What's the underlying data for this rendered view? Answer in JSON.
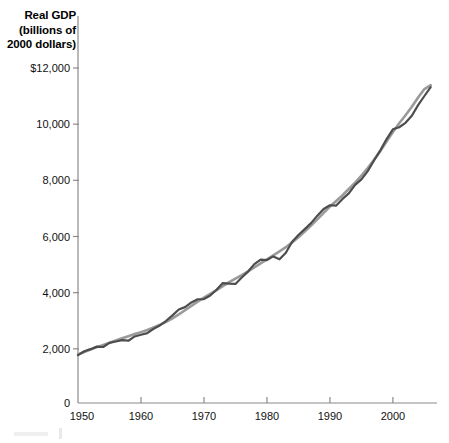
{
  "chart_data": {
    "type": "line",
    "title": "Real GDP (billions of 2000 dollars)",
    "title_line1": "Real GDP",
    "title_line2": "(billions of",
    "title_line3": "2000 dollars)",
    "xlabel": "",
    "ylabel": "Real GDP (billions of 2000 dollars)",
    "xlim": [
      1950,
      2007
    ],
    "ylim": [
      0,
      12000
    ],
    "grid": false,
    "legend_position": "none",
    "y_ticks": [
      2000,
      4000,
      6000,
      8000,
      10000,
      12000
    ],
    "y_tick_labels": [
      "2,000",
      "4,000",
      "6,000",
      "8,000",
      "10,000",
      "$12,000"
    ],
    "origin_label": "0",
    "x_ticks": [
      1950,
      1960,
      1970,
      1980,
      1990,
      2000
    ],
    "x_tick_labels": [
      "1950",
      "1960",
      "1970",
      "1980",
      "1990",
      "2000"
    ],
    "colors": {
      "actual_line": "#4d4d4d",
      "potential_line": "#9a9a9a",
      "axis": "#8a8a8a",
      "text": "#111111"
    },
    "x": [
      1950,
      1951,
      1952,
      1953,
      1954,
      1955,
      1956,
      1957,
      1958,
      1959,
      1960,
      1961,
      1962,
      1963,
      1964,
      1965,
      1966,
      1967,
      1968,
      1969,
      1970,
      1971,
      1972,
      1973,
      1974,
      1975,
      1976,
      1977,
      1978,
      1979,
      1980,
      1981,
      1982,
      1983,
      1984,
      1985,
      1986,
      1987,
      1988,
      1989,
      1990,
      1991,
      1992,
      1993,
      1994,
      1995,
      1996,
      1997,
      1998,
      1999,
      2000,
      2001,
      2002,
      2003,
      2004,
      2005,
      2006
    ],
    "series": [
      {
        "name": "Real GDP",
        "style": "solid-dark",
        "values": [
          1777,
          1915,
          1988,
          2079,
          2065,
          2213,
          2261,
          2309,
          2289,
          2441,
          2502,
          2560,
          2715,
          2834,
          2999,
          3192,
          3399,
          3485,
          3653,
          3765,
          3772,
          3899,
          4105,
          4342,
          4320,
          4311,
          4541,
          4751,
          5015,
          5173,
          5162,
          5292,
          5189,
          5424,
          5814,
          6054,
          6264,
          6475,
          6743,
          6981,
          7113,
          7101,
          7337,
          7533,
          7836,
          8032,
          8329,
          8704,
          9067,
          9470,
          9817,
          9891,
          10049,
          10301,
          10676,
          11003,
          11319
        ],
        "color": "#4d4d4d"
      },
      {
        "name": "Potential GDP",
        "style": "solid-light",
        "values": [
          1800,
          1890,
          1975,
          2060,
          2140,
          2220,
          2300,
          2375,
          2450,
          2525,
          2595,
          2670,
          2760,
          2855,
          2960,
          3085,
          3225,
          3375,
          3530,
          3680,
          3820,
          3955,
          4090,
          4230,
          4375,
          4500,
          4625,
          4760,
          4900,
          5045,
          5185,
          5325,
          5470,
          5620,
          5790,
          5975,
          6175,
          6390,
          6610,
          6840,
          7065,
          7265,
          7470,
          7690,
          7920,
          8170,
          8440,
          8730,
          9040,
          9380,
          9720,
          10030,
          10320,
          10620,
          10950,
          11250,
          11390
        ],
        "color": "#9a9a9a"
      }
    ],
    "annotations": [
      {
        "label": "1974-75 recession dip",
        "x": 1975,
        "y": 4311
      },
      {
        "label": "1982 recession dip",
        "x": 1982,
        "y": 5189
      }
    ]
  }
}
